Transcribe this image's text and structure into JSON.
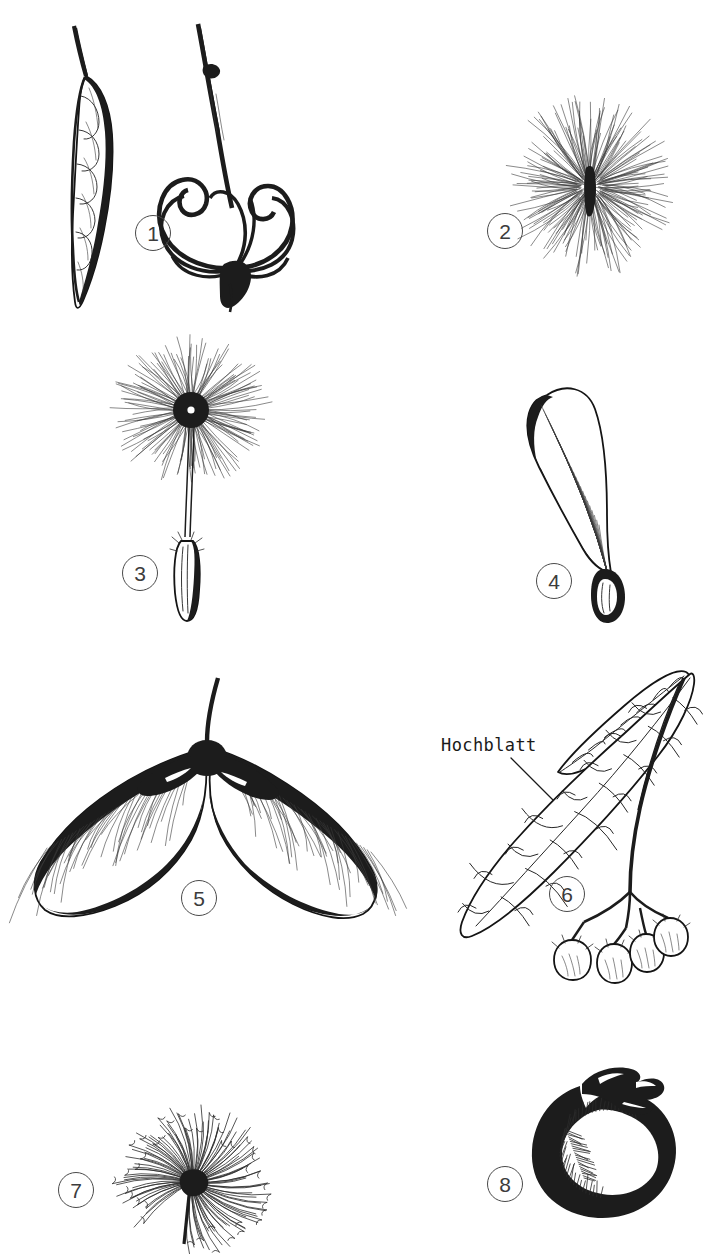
{
  "plate": {
    "kind": "botanical-line-drawing-plate",
    "background_color": "#ffffff",
    "ink_color": "#1c1c1c",
    "width": 703,
    "height": 1254,
    "figure_count": 8
  },
  "markers": [
    {
      "id": "marker-1",
      "label": "1",
      "x": 135,
      "y": 215
    },
    {
      "id": "marker-2",
      "label": "2",
      "x": 487,
      "y": 213
    },
    {
      "id": "marker-3",
      "label": "3",
      "x": 122,
      "y": 555
    },
    {
      "id": "marker-4",
      "label": "4",
      "x": 536,
      "y": 563
    },
    {
      "id": "marker-5",
      "label": "5",
      "x": 181,
      "y": 880
    },
    {
      "id": "marker-6",
      "label": "6",
      "x": 549,
      "y": 876
    },
    {
      "id": "marker-7",
      "label": "7",
      "x": 58,
      "y": 1172
    },
    {
      "id": "marker-8",
      "label": "8",
      "x": 487,
      "y": 1166
    }
  ],
  "annotations": [
    {
      "id": "hochblatt-label",
      "text": "Hochblatt",
      "x": 441,
      "y": 737,
      "leader_from_x": 520,
      "leader_from_y": 760,
      "leader_to_x": 556,
      "leader_to_y": 800
    }
  ],
  "figures": [
    {
      "id": "figure-1",
      "marker": "1",
      "subject": "legume-pod-and-split-twisted-valves",
      "description": "A narrow elongated seed pod on a stalk with visible seed bulges, beside a dehisced pod whose valves have twisted into spiral coils on a woody twig"
    },
    {
      "id": "figure-2",
      "marker": "2",
      "subject": "hairy-plumed-seed-tuft",
      "description": "Rounded tuft of fine radiating hairs around a central seed body"
    },
    {
      "id": "figure-3",
      "marker": "3",
      "subject": "pappus-parachute-achene",
      "description": "Dandelion-type achene with long beak and umbrella-like pappus of fine hairs"
    },
    {
      "id": "figure-4",
      "marker": "4",
      "subject": "single-winged-samara",
      "description": "Single curved samara with a striated membranous wing and a swollen seed at the base"
    },
    {
      "id": "figure-5",
      "marker": "5",
      "subject": "paired-maple-samara",
      "description": "Double maple samara, two winged nutlets joined at a dark thickened base with a short stalk"
    },
    {
      "id": "figure-6",
      "marker": "6",
      "subject": "linden-fruit-cluster-with-bract",
      "description": "Lime/linden infructescence: a strap-shaped veined bract fused to the peduncle bearing a cluster of four small round nutlets"
    },
    {
      "id": "figure-7",
      "marker": "7",
      "subject": "hooked-bristle-burr",
      "description": "Globular burr of numerous slender bristles ending in hooks"
    },
    {
      "id": "figure-8",
      "marker": "8",
      "subject": "kidney-shaped-seed-with-aril",
      "description": "Plump reniform dark seed with a crested fleshy appendage at the top"
    }
  ]
}
